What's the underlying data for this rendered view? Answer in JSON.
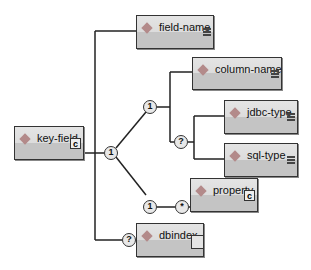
{
  "root": {
    "label": "key-field",
    "icon": "complex-type-icon"
  },
  "children": {
    "field_name": {
      "label": "field-name",
      "icon": "simple-content-icon"
    },
    "column_name": {
      "label": "column-name",
      "icon": "simple-content-icon"
    },
    "jdbc_type": {
      "label": "jdbc-type",
      "icon": "simple-content-icon"
    },
    "sql_type": {
      "label": "sql-type",
      "icon": "simple-content-icon"
    },
    "property": {
      "label": "property",
      "icon": "complex-type-icon"
    },
    "dbindex": {
      "label": "dbindex",
      "icon": "empty-content-icon"
    }
  },
  "connectors": {
    "choice_main": "1",
    "seq_column": "1",
    "opt_types": "?",
    "seq_property": "1",
    "many_property": "*",
    "opt_dbindex": "?"
  },
  "glyphs": {
    "complex": "c"
  },
  "colors": {
    "node_top": "#e4e4e4",
    "node_bottom": "#c4c4c4",
    "border": "#333333",
    "diamond": "#b38a8a"
  }
}
